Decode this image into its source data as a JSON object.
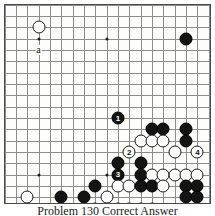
{
  "figure": {
    "type": "go-board-diagram",
    "caption": "Problem 130  Correct Answer",
    "board": {
      "columns": 18,
      "rows": 17,
      "line_color": "#8d8d8d",
      "border_color": "#4a4a4a",
      "background_color": "#fdfdfb",
      "star_points": [
        {
          "col": 3,
          "row": 3
        },
        {
          "col": 9,
          "row": 3
        },
        {
          "col": 3,
          "row": 15
        },
        {
          "col": 9,
          "row": 15
        },
        {
          "col": 16,
          "row": 3
        },
        {
          "col": 16,
          "row": 15
        }
      ]
    },
    "labels": [
      {
        "text": "a",
        "col": 3,
        "row": 4
      }
    ],
    "stones": [
      {
        "color": "white",
        "col": 3,
        "row": 2,
        "label": ""
      },
      {
        "color": "black",
        "col": 16,
        "row": 3,
        "label": ""
      },
      {
        "color": "black",
        "col": 10,
        "row": 10,
        "label": "1"
      },
      {
        "color": "black",
        "col": 13,
        "row": 11,
        "label": ""
      },
      {
        "color": "black",
        "col": 14,
        "row": 11,
        "label": ""
      },
      {
        "color": "black",
        "col": 16,
        "row": 11,
        "label": ""
      },
      {
        "color": "white",
        "col": 12,
        "row": 12,
        "label": ""
      },
      {
        "color": "white",
        "col": 13,
        "row": 12,
        "label": ""
      },
      {
        "color": "white",
        "col": 14,
        "row": 12,
        "label": ""
      },
      {
        "color": "black",
        "col": 16,
        "row": 12,
        "label": ""
      },
      {
        "color": "white",
        "col": 11,
        "row": 13,
        "label": "2"
      },
      {
        "color": "white",
        "col": 15,
        "row": 13,
        "label": ""
      },
      {
        "color": "white",
        "col": 17,
        "row": 13,
        "label": "4"
      },
      {
        "color": "black",
        "col": 10,
        "row": 14,
        "label": ""
      },
      {
        "color": "black",
        "col": 12,
        "row": 14,
        "label": ""
      },
      {
        "color": "black",
        "col": 10,
        "row": 15,
        "label": "3"
      },
      {
        "color": "black",
        "col": 12,
        "row": 15,
        "label": ""
      },
      {
        "color": "white",
        "col": 13,
        "row": 15,
        "label": ""
      },
      {
        "color": "white",
        "col": 14,
        "row": 15,
        "label": ""
      },
      {
        "color": "white",
        "col": 15,
        "row": 15,
        "label": ""
      },
      {
        "color": "white",
        "col": 16,
        "row": 15,
        "label": ""
      },
      {
        "color": "white",
        "col": 17,
        "row": 15,
        "label": ""
      },
      {
        "color": "black",
        "col": 8,
        "row": 16,
        "label": ""
      },
      {
        "color": "white",
        "col": 10,
        "row": 16,
        "label": ""
      },
      {
        "color": "white",
        "col": 11,
        "row": 16,
        "label": ""
      },
      {
        "color": "black",
        "col": 12,
        "row": 16,
        "label": ""
      },
      {
        "color": "black",
        "col": 13,
        "row": 16,
        "label": ""
      },
      {
        "color": "white",
        "col": 14,
        "row": 16,
        "label": ""
      },
      {
        "color": "black",
        "col": 16,
        "row": 16,
        "label": ""
      },
      {
        "color": "black",
        "col": 17,
        "row": 16,
        "label": ""
      },
      {
        "color": "white",
        "col": 2,
        "row": 17,
        "label": ""
      },
      {
        "color": "black",
        "col": 5,
        "row": 17,
        "label": ""
      },
      {
        "color": "black",
        "col": 7,
        "row": 17,
        "label": ""
      },
      {
        "color": "white",
        "col": 9,
        "row": 17,
        "label": ""
      },
      {
        "color": "black",
        "col": 16,
        "row": 17,
        "label": ""
      },
      {
        "color": "black",
        "col": 17,
        "row": 17,
        "label": ""
      },
      {
        "color": "white",
        "col": 7,
        "row": 18,
        "label": ""
      },
      {
        "color": "white",
        "col": 8,
        "row": 18,
        "label": ""
      },
      {
        "color": "black",
        "col": 10,
        "row": 18,
        "label": ""
      },
      {
        "color": "white",
        "col": 11,
        "row": 18,
        "label": ""
      },
      {
        "color": "white",
        "col": 12,
        "row": 18,
        "label": ""
      },
      {
        "color": "black",
        "col": 13,
        "row": 18,
        "label": ""
      }
    ]
  }
}
